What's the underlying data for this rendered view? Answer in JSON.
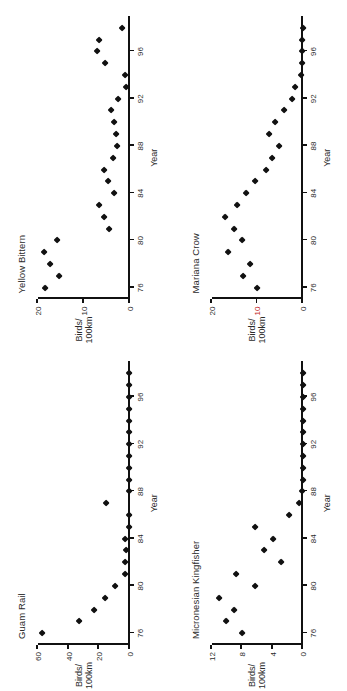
{
  "figure": {
    "orientation": "rotated-90-ccw",
    "axis_color": "#111111",
    "marker_color": "#111111",
    "highlight_tick_color": "#c01a1a"
  },
  "labels": {
    "year_axis": "Year",
    "birds_line1": "Birds/",
    "birds_line2": "100km"
  },
  "chart_data": [
    {
      "type": "scatter",
      "title": "Guam Rail",
      "xlabel": "Year",
      "ylabel": "Birds/100km",
      "xlim": [
        75,
        99
      ],
      "ylim": [
        0,
        60
      ],
      "xticks": [
        76,
        80,
        84,
        88,
        92,
        96
      ],
      "yticks": [
        0,
        20,
        40,
        60
      ],
      "grid": false,
      "legend": "none",
      "x": [
        76,
        77,
        78,
        79,
        80,
        81,
        82,
        83,
        84,
        85,
        86,
        87,
        88,
        89,
        90,
        91,
        92,
        93,
        94,
        95,
        96,
        97,
        98
      ],
      "y": [
        57,
        33,
        23,
        16,
        9,
        3,
        3,
        2,
        3,
        0,
        0,
        15,
        0,
        0,
        0,
        0,
        0,
        0,
        0,
        0,
        0,
        0,
        0
      ]
    },
    {
      "type": "scatter",
      "title": "Yellow Bittern",
      "xlabel": "Year",
      "ylabel": "Birds/100km",
      "xlim": [
        75,
        99
      ],
      "ylim": [
        0,
        20
      ],
      "xticks": [
        76,
        80,
        84,
        88,
        92,
        96
      ],
      "yticks": [
        0,
        10,
        20
      ],
      "grid": false,
      "legend": "none",
      "x": [
        76,
        77,
        78,
        79,
        80,
        81,
        82,
        83,
        84,
        85,
        86,
        87,
        88,
        89,
        90,
        91,
        92,
        93,
        94,
        95,
        96,
        97,
        98
      ],
      "y": [
        18.3,
        15.4,
        17.3,
        18.7,
        15.7,
        4.4,
        5.4,
        6.5,
        3.3,
        4.7,
        5.4,
        3.6,
        2.6,
        2.9,
        3.3,
        4.0,
        2.4,
        0.6,
        0.9,
        5.2,
        7.1,
        6.6,
        1.5
      ]
    },
    {
      "type": "scatter",
      "title": "Micronesian Kingfisher",
      "xlabel": "Year",
      "ylabel": "Birds/100km",
      "xlim": [
        75,
        99
      ],
      "ylim": [
        0,
        12
      ],
      "xticks": [
        76,
        80,
        84,
        88,
        92,
        96
      ],
      "yticks": [
        0,
        4,
        8,
        12
      ],
      "grid": false,
      "legend": "none",
      "x": [
        76,
        77,
        78,
        79,
        80,
        81,
        82,
        83,
        84,
        85,
        86,
        87,
        88,
        89,
        90,
        91,
        92,
        93,
        94,
        95,
        96,
        97,
        98
      ],
      "y": [
        8.0,
        10.1,
        9.0,
        11.0,
        6.3,
        8.7,
        2.8,
        5.0,
        3.9,
        6.2,
        1.8,
        0.5,
        0.1,
        0,
        0,
        0,
        0,
        0,
        0,
        0,
        0,
        0,
        0
      ]
    },
    {
      "type": "scatter",
      "title": "Mariana Crow",
      "xlabel": "Year",
      "ylabel": "Birds/100km",
      "xlim": [
        75,
        99
      ],
      "ylim": [
        0,
        20
      ],
      "xticks": [
        76,
        80,
        84,
        88,
        92,
        96
      ],
      "yticks": [
        0,
        10,
        20
      ],
      "grid": false,
      "legend": "none",
      "x": [
        76,
        77,
        78,
        79,
        80,
        81,
        82,
        83,
        84,
        85,
        86,
        87,
        88,
        89,
        90,
        91,
        92,
        93,
        94,
        95,
        96,
        97,
        98
      ],
      "y": [
        9.9,
        13.1,
        11.5,
        16.4,
        13.3,
        14.9,
        16.9,
        14.3,
        12.4,
        10.5,
        8.0,
        6.8,
        5.2,
        7.4,
        6.0,
        4.0,
        2.4,
        1.6,
        0.4,
        0.2,
        0.2,
        0.1,
        0.0
      ]
    }
  ]
}
